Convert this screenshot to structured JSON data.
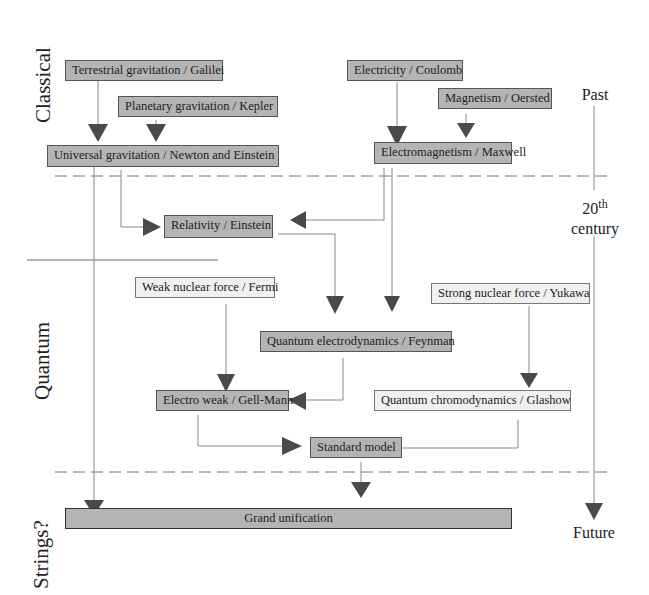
{
  "eras": {
    "classical": "Classical",
    "quantum": "Quantum",
    "strings": "Strings?"
  },
  "timeline": {
    "past": "Past",
    "twentieth": "20",
    "twentieth_sup": "th",
    "century": "century",
    "future": "Future"
  },
  "nodes": {
    "terrestrial": "Terrestrial gravitation / Galilei",
    "planetary": "Planetary gravitation / Kepler",
    "universal": "Universal gravitation / Newton and Einstein",
    "electricity": "Electricity / Coulomb",
    "magnetism": "Magnetism / Oersted",
    "electromagnetism": "Electromagnetism / Maxwell",
    "relativity": "Relativity / Einstein",
    "weak": "Weak nuclear force / Fermi",
    "strong": "Strong nuclear force / Yukawa",
    "qed": "Quantum electrodynamics / Feynman",
    "electroweak": "Electro weak / Gell-Mann",
    "qcd": "Quantum chromodynamics  / Glashow",
    "standard": "Standard model",
    "grand": "Grand unification"
  },
  "colors": {
    "dark_box": "#b4b4b4",
    "light_box": "#f0f0f0",
    "arrow": "#4a4a4a",
    "line": "#888888"
  }
}
